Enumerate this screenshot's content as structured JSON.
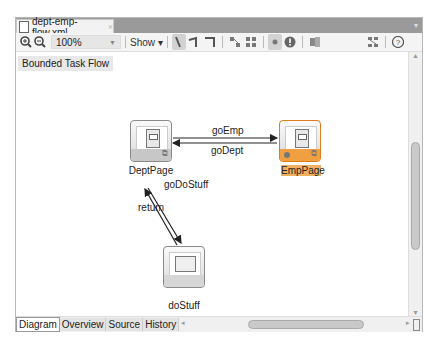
{
  "editor": {
    "tab_title": "dept-emp-flow.xml",
    "tab_close": "×"
  },
  "toolbar": {
    "zoom_in": "zoom-in-icon",
    "zoom_out": "zoom-out-icon",
    "zoom_level": "100%",
    "show_label": "Show ▾"
  },
  "canvas": {
    "breadcrumb": "Bounded Task Flow",
    "nodes": [
      {
        "label": "DeptPage"
      },
      {
        "label": "EmpPage",
        "selected": true
      },
      {
        "label": "doStuff"
      }
    ],
    "edges": [
      {
        "label": "goEmp"
      },
      {
        "label": "goDept"
      },
      {
        "label": "goDoStuff"
      },
      {
        "label": "return"
      }
    ]
  },
  "bottom_tabs": [
    {
      "label": "Diagram",
      "active": true
    },
    {
      "label": "Overview"
    },
    {
      "label": "Source"
    },
    {
      "label": "History"
    }
  ],
  "colors": {
    "selection": "#f0a040"
  }
}
